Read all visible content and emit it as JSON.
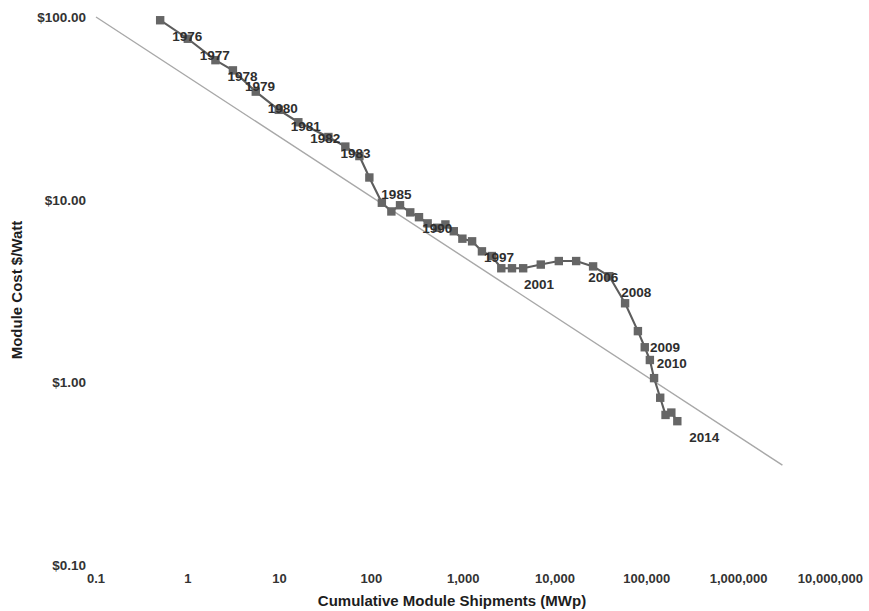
{
  "chart_data": {
    "type": "line",
    "title": "",
    "xlabel": "Cumulative Module Shipments (MWp)",
    "ylabel": "Module Cost $/Watt",
    "xscale": "log",
    "yscale": "log",
    "xlim": [
      0.1,
      10000000
    ],
    "ylim": [
      0.1,
      100
    ],
    "grid": false,
    "legend": "none",
    "xtick_labels": [
      "0.1",
      "1",
      "10",
      "100",
      "1,000",
      "10,000",
      "100,000",
      "1,000,000",
      "10,000,000"
    ],
    "xtick_values": [
      0.1,
      1,
      10,
      100,
      1000,
      10000,
      100000,
      1000000,
      10000000
    ],
    "ytick_labels": [
      "$100.00",
      "$10.00",
      "$1.00",
      "$0.10"
    ],
    "ytick_values": [
      100,
      10,
      1,
      0.1
    ],
    "series": [
      {
        "name": "Module Cost vs Cumulative Shipments",
        "marker": "square",
        "color": "#666666",
        "points": [
          {
            "x": 0.5,
            "y": 96.0,
            "label": "1976"
          },
          {
            "x": 1.0,
            "y": 76.0,
            "label": "1977"
          },
          {
            "x": 2.0,
            "y": 58.0,
            "label": "1978"
          },
          {
            "x": 3.1,
            "y": 51.0,
            "label": "1979"
          },
          {
            "x": 5.5,
            "y": 39.0,
            "label": "1980"
          },
          {
            "x": 9.8,
            "y": 31.0,
            "label": "1981"
          },
          {
            "x": 16.0,
            "y": 26.5,
            "label": "1982"
          },
          {
            "x": 34.0,
            "y": 22.0,
            "label": "1983"
          },
          {
            "x": 52.0,
            "y": 19.5,
            "label": ""
          },
          {
            "x": 74.0,
            "y": 17.3,
            "label": ""
          },
          {
            "x": 95.0,
            "y": 13.2,
            "label": "1985"
          },
          {
            "x": 130.0,
            "y": 9.6,
            "label": ""
          },
          {
            "x": 165.0,
            "y": 8.6,
            "label": ""
          },
          {
            "x": 205.0,
            "y": 9.3,
            "label": ""
          },
          {
            "x": 265.0,
            "y": 8.5,
            "label": "1990"
          },
          {
            "x": 330.0,
            "y": 8.0,
            "label": ""
          },
          {
            "x": 410.0,
            "y": 7.4,
            "label": ""
          },
          {
            "x": 520.0,
            "y": 7.0,
            "label": ""
          },
          {
            "x": 640.0,
            "y": 7.3,
            "label": ""
          },
          {
            "x": 790.0,
            "y": 6.7,
            "label": ""
          },
          {
            "x": 980.0,
            "y": 6.1,
            "label": ""
          },
          {
            "x": 1250.0,
            "y": 5.9,
            "label": "1997"
          },
          {
            "x": 1600.0,
            "y": 5.2,
            "label": ""
          },
          {
            "x": 2050.0,
            "y": 4.9,
            "label": ""
          },
          {
            "x": 2600.0,
            "y": 4.2,
            "label": ""
          },
          {
            "x": 3400.0,
            "y": 4.2,
            "label": "2001"
          },
          {
            "x": 4500.0,
            "y": 4.2,
            "label": ""
          },
          {
            "x": 7000.0,
            "y": 4.4,
            "label": ""
          },
          {
            "x": 11000.0,
            "y": 4.6,
            "label": ""
          },
          {
            "x": 17000.0,
            "y": 4.6,
            "label": "2006"
          },
          {
            "x": 26000.0,
            "y": 4.3,
            "label": ""
          },
          {
            "x": 39000.0,
            "y": 3.8,
            "label": "2008"
          },
          {
            "x": 58000.0,
            "y": 2.7,
            "label": ""
          },
          {
            "x": 80000.0,
            "y": 1.9,
            "label": "2009"
          },
          {
            "x": 95000.0,
            "y": 1.55,
            "label": "2010"
          },
          {
            "x": 108000.0,
            "y": 1.32,
            "label": ""
          },
          {
            "x": 120000.0,
            "y": 1.05,
            "label": ""
          },
          {
            "x": 140000.0,
            "y": 0.82,
            "label": ""
          },
          {
            "x": 160000.0,
            "y": 0.66,
            "label": ""
          },
          {
            "x": 185000.0,
            "y": 0.68,
            "label": ""
          },
          {
            "x": 215000.0,
            "y": 0.61,
            "label": "2014"
          }
        ]
      }
    ],
    "trend_line": {
      "name": "experience-curve-fit",
      "color": "#a8a8a8",
      "start": {
        "x": 0.1,
        "y": 100.0
      },
      "end": {
        "x": 3000000.0,
        "y": 0.35
      }
    }
  },
  "labels": {
    "y_axis_title": "Module Cost $/Watt",
    "x_axis_title": "Cumulative Module Shipments (MWp)"
  }
}
